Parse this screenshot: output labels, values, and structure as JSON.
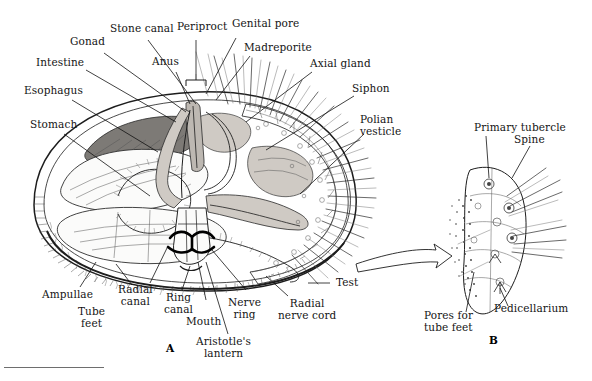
{
  "figure": {
    "panels": [
      {
        "id": "A",
        "caption": "A"
      },
      {
        "id": "B",
        "caption": "B"
      }
    ]
  },
  "panel_a": {
    "labels": [
      {
        "key": "gonad",
        "text": "Gonad"
      },
      {
        "key": "stone_canal",
        "text": "Stone canal"
      },
      {
        "key": "periproct",
        "text": "Periproct"
      },
      {
        "key": "genital_pore",
        "text": "Genital pore"
      },
      {
        "key": "intestine",
        "text": "Intestine"
      },
      {
        "key": "anus",
        "text": "Anus"
      },
      {
        "key": "madreporite",
        "text": "Madreporite"
      },
      {
        "key": "esophagus",
        "text": "Esophagus"
      },
      {
        "key": "axial_gland",
        "text": "Axial gland"
      },
      {
        "key": "siphon",
        "text": "Siphon"
      },
      {
        "key": "stomach",
        "text": "Stomach"
      },
      {
        "key": "polian_vesticle",
        "text": "Polian\nvesticle"
      },
      {
        "key": "ampullae",
        "text": "Ampullae"
      },
      {
        "key": "radial_canal",
        "text": "Radial\ncanal"
      },
      {
        "key": "tube_feet",
        "text": "Tube\nfeet"
      },
      {
        "key": "ring_canal",
        "text": "Ring\ncanal"
      },
      {
        "key": "mouth",
        "text": "Mouth"
      },
      {
        "key": "nerve_ring",
        "text": "Nerve\nring"
      },
      {
        "key": "aristotles_lantern",
        "text": "Aristotle's\nlantern"
      },
      {
        "key": "test",
        "text": "Test"
      },
      {
        "key": "radial_nerve_cord",
        "text": "Radial\nnerve cord"
      }
    ]
  },
  "panel_b": {
    "labels": [
      {
        "key": "primary_tubercle",
        "text": "Primary tubercle"
      },
      {
        "key": "spine",
        "text": "Spine"
      },
      {
        "key": "pedicellarium",
        "text": "Pedicellarium"
      },
      {
        "key": "pores_tube_feet",
        "text": "Pores for\ntube feet"
      }
    ]
  },
  "colors": {
    "ink": "#1d1d1d",
    "label_text": "#141414",
    "gonad_fill": "#7d7a76",
    "organ_fill": "#cfcac4",
    "background": "#ffffff"
  }
}
